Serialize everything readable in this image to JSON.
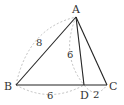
{
  "diagram": {
    "type": "triangle",
    "points": {
      "A": {
        "label": "A",
        "x": 76,
        "y": 17
      },
      "B": {
        "label": "B",
        "x": 16,
        "y": 85
      },
      "C": {
        "label": "C",
        "x": 107,
        "y": 85
      },
      "D": {
        "label": "D",
        "x": 84,
        "y": 85
      }
    },
    "segments": [
      "AB",
      "AC",
      "BC",
      "AD"
    ],
    "measurements": {
      "AB": "8",
      "AD": "6",
      "BD": "6",
      "DC": "2"
    },
    "colors": {
      "line": "#222222",
      "dashed_arc": "#aaaaaa",
      "text": "#333333"
    }
  }
}
